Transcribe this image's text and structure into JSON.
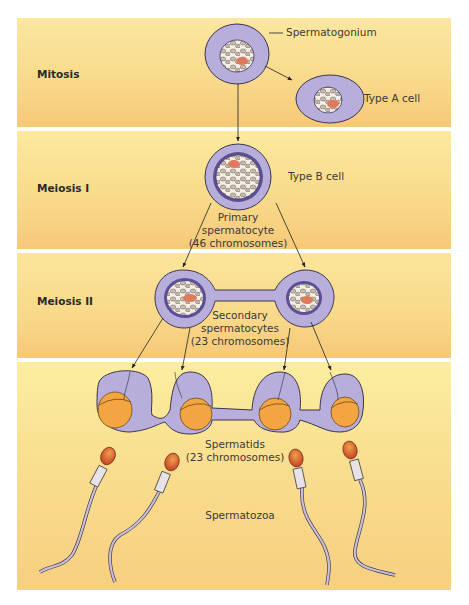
{
  "stages": [
    {
      "label": "Mitosis"
    },
    {
      "label": "Meiosis I"
    },
    {
      "label": "Meiosis II"
    },
    {
      "label": ""
    }
  ],
  "labels": {
    "spermatogonium": "Spermatogonium",
    "type_a": "Type A cell",
    "type_b": "Type B cell",
    "primary_l1": "Primary",
    "primary_l2": "spermatocyte",
    "primary_l3": "(46 chromosomes)",
    "secondary_l1": "Secondary",
    "secondary_l2": "spermatocytes",
    "secondary_l3": "(23 chromosomes)",
    "spermatids_l1": "Spermatids",
    "spermatids_l2": "(23 chromosomes)",
    "spermatozoa": "Spermatozoa"
  },
  "colors": {
    "band": "#f8d98a",
    "cytoplasm": "#b7aedb",
    "membrane": "#3d3450",
    "nucleus_ring": "#5d4f95",
    "chromatin": "#c9bdb0",
    "nucleolus": "#e07a5f",
    "acrosome": "#f2a540",
    "tail": "#c9bfd6"
  }
}
